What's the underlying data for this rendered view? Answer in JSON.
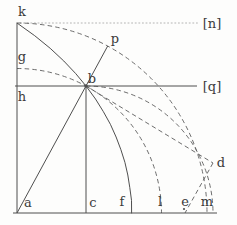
{
  "figure": {
    "canvas": {
      "width": 237,
      "height": 225,
      "background": "#fdfdfc"
    },
    "style": {
      "solid_color": "#4f4f4f",
      "dashed_color": "#5c5c5c",
      "dotted_color": "#ababab",
      "label_color": "#3b3b3b",
      "label_size": 13,
      "solid_width": 1,
      "dashed_width": 0.9,
      "dash_pattern": "4.5 3.2",
      "dot_pattern": "1 2.6"
    },
    "labels": [
      {
        "id": "k",
        "text": "k",
        "x": 22,
        "y": 16
      },
      {
        "id": "n",
        "text": "[n]",
        "x": 212,
        "y": 28
      },
      {
        "id": "p",
        "text": "p",
        "x": 115,
        "y": 43
      },
      {
        "id": "g",
        "text": "g",
        "x": 22,
        "y": 61
      },
      {
        "id": "b",
        "text": "b",
        "x": 92,
        "y": 83
      },
      {
        "id": "q",
        "text": "[q]",
        "x": 212,
        "y": 91
      },
      {
        "id": "h",
        "text": "h",
        "x": 22,
        "y": 101
      },
      {
        "id": "d",
        "text": "d",
        "x": 221,
        "y": 167
      },
      {
        "id": "a",
        "text": "a",
        "x": 28,
        "y": 207
      },
      {
        "id": "c",
        "text": "c",
        "x": 93,
        "y": 207
      },
      {
        "id": "f",
        "text": "f",
        "x": 122,
        "y": 206
      },
      {
        "id": "l",
        "text": "l",
        "x": 160,
        "y": 206
      },
      {
        "id": "e",
        "text": "e",
        "x": 185,
        "y": 206
      },
      {
        "id": "m",
        "text": "m",
        "x": 207,
        "y": 206
      }
    ],
    "solid_lines": [
      {
        "id": "left-side-ka",
        "x1": 17,
        "y1": 23,
        "x2": 17,
        "y2": 213
      },
      {
        "id": "bottom-side-am",
        "x1": 13,
        "y1": 213,
        "x2": 217,
        "y2": 213
      },
      {
        "id": "horizontal-line-q",
        "x1": 15,
        "y1": 86,
        "x2": 197,
        "y2": 86
      },
      {
        "id": "vertical-bc",
        "x1": 86,
        "y1": 86,
        "x2": 86,
        "y2": 213
      },
      {
        "id": "ray-a-b-p",
        "x1": 17,
        "y1": 213,
        "x2": 107.7,
        "y2": 46
      }
    ],
    "dotted_lines": [
      {
        "id": "horizontal-line-n",
        "x1": 20,
        "y1": 23,
        "x2": 198,
        "y2": 23
      }
    ],
    "dashed_paths": [
      {
        "id": "quarter-arc-k-to-m-center-a",
        "d": "M 17 23 A 190 190 0 0 1 207 213"
      },
      {
        "id": "arc-g-b-l-center-a",
        "d": "M 17 68.5 A 144.5 144.5 0 0 1 161.5 213"
      },
      {
        "id": "arc-b-to-m-center-c",
        "d": "M 86 86 A 127 127 0 0 1 213 213"
      },
      {
        "id": "segment-b-d",
        "d": "M 86 86 L 213 163"
      },
      {
        "id": "segment-d-e",
        "d": "M 213 163 L 185 213"
      }
    ],
    "solid_curves": [
      {
        "id": "quadratrix-k-b-f",
        "points": [
          [
            17,
            23
          ],
          [
            34.7,
            35.7
          ],
          [
            50.2,
            48.3
          ],
          [
            63.8,
            61
          ],
          [
            75.8,
            73.7
          ],
          [
            86,
            86
          ],
          [
            95.5,
            99
          ],
          [
            103.4,
            111.7
          ],
          [
            110.4,
            124.3
          ],
          [
            116.1,
            137
          ],
          [
            120.9,
            149.7
          ],
          [
            124.9,
            162.3
          ],
          [
            127.8,
            175
          ],
          [
            129.8,
            187.7
          ],
          [
            131.5,
            200.3
          ],
          [
            131.6,
            213
          ]
        ]
      }
    ],
    "points": [
      {
        "id": "point-b",
        "x": 86,
        "y": 86,
        "r": 1.7
      },
      {
        "id": "point-e",
        "x": 184,
        "y": 209,
        "r": 1.1
      }
    ]
  }
}
